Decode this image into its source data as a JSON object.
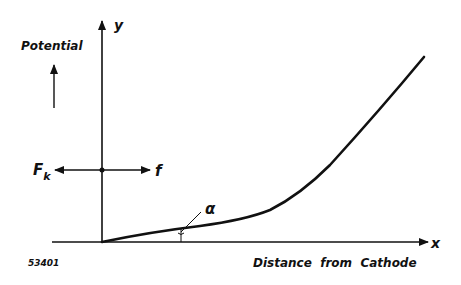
{
  "diagram": {
    "type": "potential-vs-distance",
    "y_axis_label": "y",
    "x_axis_label": "x",
    "potential_label": "Potential",
    "distance_label": "Distance  from  Cathode",
    "force_left_label": "F",
    "force_left_subscript": "k",
    "force_right_label": "f",
    "angle_label": "α",
    "figure_number": "53401",
    "colors": {
      "line": "#111111",
      "background": "#ffffff"
    }
  }
}
